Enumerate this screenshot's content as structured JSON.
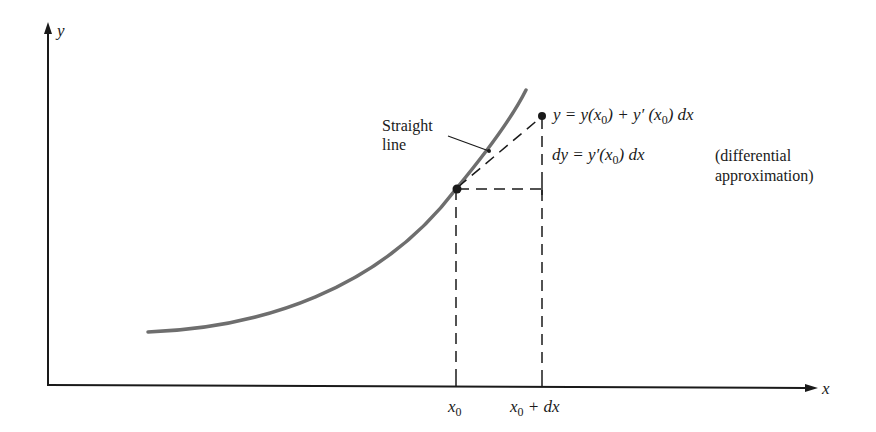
{
  "diagram": {
    "type": "differential-approximation-diagram",
    "axes": {
      "x_label": "x",
      "y_label": "y"
    },
    "x_ticks": [
      {
        "label_base": "x",
        "label_sub": "0",
        "label_suffix": ""
      },
      {
        "label_base": "x",
        "label_sub": "0",
        "label_suffix": " + dx"
      }
    ],
    "annotations": {
      "straight_line": [
        "Straight",
        "line"
      ],
      "tangent_eq": {
        "p1": "y = y(x",
        "sub1": "0",
        "p2": ") + y′ (x",
        "sub2": "0",
        "p3": ") dx"
      },
      "dy_eq": {
        "p1": "dy = y′(x",
        "sub1": "0",
        "p2": ") dx"
      },
      "note": [
        "(differential",
        "approximation)"
      ]
    },
    "colors": {
      "curve": "#6e6e6e",
      "ink": "#1a1a1a",
      "background": "#ffffff"
    }
  }
}
